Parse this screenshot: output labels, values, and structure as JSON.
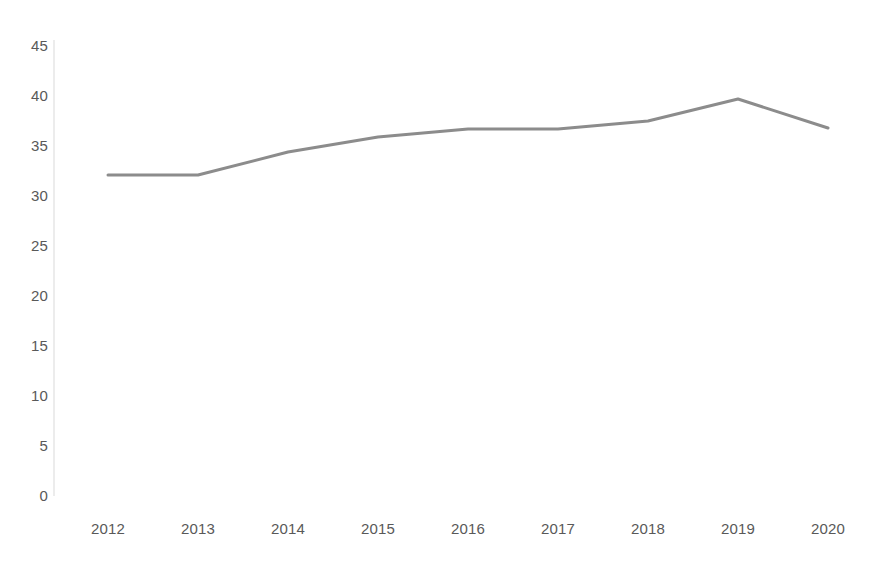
{
  "chart_data": {
    "type": "line",
    "title": "",
    "subtitle": "",
    "xlabel": "",
    "ylabel": "",
    "categories": [
      "2012",
      "2013",
      "2014",
      "2015",
      "2016",
      "2017",
      "2018",
      "2019",
      "2020"
    ],
    "series": [
      {
        "name": "",
        "color": "#8c8c8c",
        "values": [
          32.0,
          32.0,
          34.3,
          35.8,
          36.6,
          36.6,
          37.4,
          39.6,
          36.7
        ]
      }
    ],
    "x_tick_labels": [
      "2012",
      "2013",
      "2014",
      "2015",
      "2016",
      "2017",
      "2018",
      "2019",
      "2020"
    ],
    "y_tick_labels": [
      "45",
      "40",
      "35",
      "30",
      "25",
      "20",
      "15",
      "10",
      "5",
      "0"
    ],
    "y_tick_values": [
      45,
      40,
      35,
      30,
      25,
      20,
      15,
      10,
      5,
      0
    ],
    "ylim": [
      0,
      45
    ],
    "y_tick_step": 5,
    "grid": false,
    "legend": false,
    "legend_position": "none",
    "markers": false,
    "line_width": 3,
    "axis_color": "#d9d9d9",
    "tick_label_color": "#595959",
    "background_color": "#ffffff"
  },
  "layout": {
    "plot_left_px": 54,
    "plot_right_px": 866,
    "y_top_px": 45,
    "y_bottom_px": 495,
    "x_first_px": 108,
    "x_spacing_px": 90,
    "x_label_y_px": 521
  }
}
